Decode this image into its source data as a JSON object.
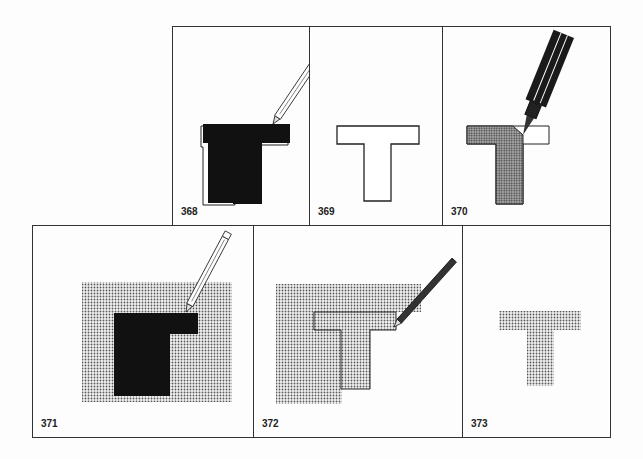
{
  "figure": {
    "panels": [
      {
        "id": "368",
        "label": "368",
        "description": "Black filled T being outlined with a pencil"
      },
      {
        "id": "369",
        "label": "369",
        "description": "White T outline"
      },
      {
        "id": "370",
        "label": "370",
        "description": "T being filled with dotted screen tone using a marker"
      },
      {
        "id": "371",
        "label": "371",
        "description": "Black T on dotted rectangle with pencil"
      },
      {
        "id": "372",
        "label": "372",
        "description": "Dotted T outlined over dotted background with pencil"
      },
      {
        "id": "373",
        "label": "373",
        "description": "Dotted T alone"
      }
    ]
  }
}
